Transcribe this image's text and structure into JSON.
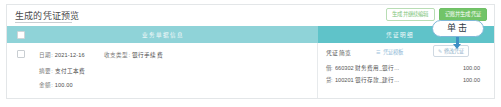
{
  "panel": {
    "title": "生成的凭证预览"
  },
  "header_actions": {
    "secondary_label": "生成并继续编辑",
    "primary_label": "记账并生成凭证"
  },
  "table_header": {
    "left_column": "业务单据信息",
    "right_column": "凭证明细"
  },
  "row": {
    "date_label": "日期:",
    "date_value": "2021-12-16",
    "type_label": "收支类型:",
    "type_value": "银行手续费",
    "digest_label": "摘要:",
    "digest_value": "支付工本费",
    "amount_label": "金额:",
    "amount_value": "100.00"
  },
  "voucher": {
    "head_label": "凭证简览",
    "link_label": "凭证模板",
    "link_icon": "list-icon",
    "edit_label": "修改凭证",
    "edit_icon": "pencil-icon",
    "entries": [
      {
        "direction": "借:",
        "subject": "660302 财务费用_银行...",
        "amount": "100.00"
      },
      {
        "direction": "贷:",
        "subject": "100201 银行存款_建行...",
        "amount": "100.00"
      }
    ]
  },
  "annotation": {
    "label": "单击"
  },
  "colors": {
    "header_left": "#8fd3d8",
    "header_right": "#5fc3c9",
    "primary_button": "#72c468",
    "annotation_border": "#7fb8d8",
    "annotation_arrow": "#3f8fc4"
  }
}
